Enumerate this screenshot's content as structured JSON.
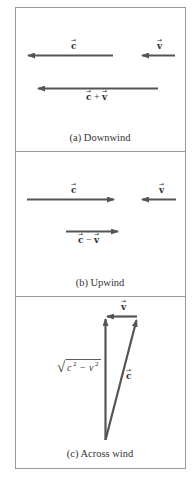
{
  "figure": {
    "colors": {
      "vector": "#555555",
      "frame": "#9a9a9a",
      "text": "#333333",
      "background": "#ffffff"
    },
    "panels": [
      {
        "id": "a",
        "caption": "(a) Downwind",
        "vectors": [
          {
            "name": "c",
            "label": "c",
            "direction": "left"
          },
          {
            "name": "v",
            "label": "v",
            "direction": "left"
          },
          {
            "name": "c_plus_v",
            "label_parts": [
              "c",
              "+",
              "v"
            ],
            "direction": "left"
          }
        ]
      },
      {
        "id": "b",
        "caption": "(b) Upwind",
        "vectors": [
          {
            "name": "c",
            "label": "c",
            "direction": "right"
          },
          {
            "name": "v",
            "label": "v",
            "direction": "left"
          },
          {
            "name": "c_minus_v",
            "label_parts": [
              "c",
              "−",
              "v"
            ],
            "direction": "right"
          }
        ]
      },
      {
        "id": "c",
        "caption": "(c) Across wind",
        "vectors": [
          {
            "name": "v",
            "label": "v",
            "direction": "left"
          },
          {
            "name": "c",
            "label": "c",
            "direction": "up-right"
          },
          {
            "name": "resultant",
            "direction": "up"
          }
        ],
        "resultant_label": {
          "radical": "√",
          "c": "c",
          "exp1": "2",
          "minus": "−",
          "v": "v",
          "exp2": "2"
        }
      }
    ],
    "vector_arrow_glyph": "→"
  }
}
